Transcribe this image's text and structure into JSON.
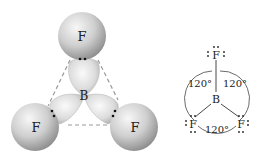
{
  "model": {
    "atoms": {
      "top": "F",
      "left": "F",
      "right": "F",
      "center": "B"
    },
    "lone_pair": "••"
  },
  "lewis": {
    "atoms": {
      "top": "F",
      "left": "F",
      "right": "F",
      "center": "B"
    },
    "angles": {
      "upper_left": "120°",
      "upper_right": "120°",
      "bottom": "120°"
    }
  },
  "colors": {
    "sphere_light": "#f4f4f4",
    "sphere_dark": "#9a9a9a",
    "dash": "#999999",
    "text": "#222222"
  }
}
